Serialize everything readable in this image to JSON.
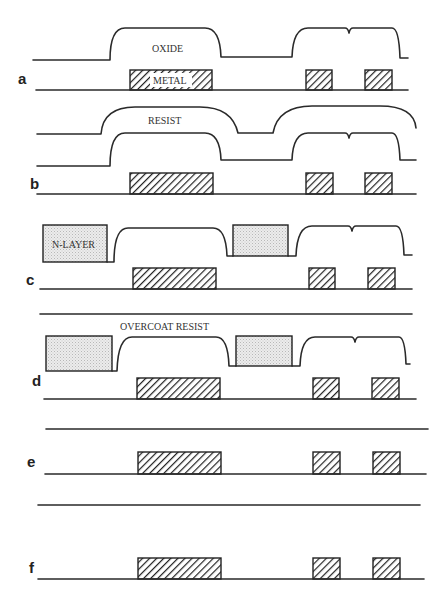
{
  "figure": {
    "steps": [
      {
        "id": "a",
        "label": "a",
        "layers": [
          "OXIDE",
          "METAL"
        ]
      },
      {
        "id": "b",
        "label": "b",
        "layers": [
          "RESIST",
          "OXIDE",
          "METAL"
        ]
      },
      {
        "id": "c",
        "label": "c",
        "layers": [
          "N-LAYER",
          "OXIDE",
          "METAL"
        ]
      },
      {
        "id": "d",
        "label": "d",
        "layers": [
          "OVERCOAT RESIST",
          "N-LAYER",
          "OXIDE",
          "METAL"
        ]
      },
      {
        "id": "e",
        "label": "e",
        "layers": [
          "METAL"
        ]
      },
      {
        "id": "f",
        "label": "f",
        "layers": [
          "METAL"
        ]
      }
    ],
    "labels": {
      "oxide": "OXIDE",
      "metal": "METAL",
      "resist": "RESIST",
      "n_layer": "N-LAYER",
      "overcoat_resist": "OVERCOAT RESIST"
    },
    "colors": {
      "line": "#2a2a2a",
      "n_layer_fill": "#e6e6e6",
      "background": "#ffffff"
    }
  }
}
